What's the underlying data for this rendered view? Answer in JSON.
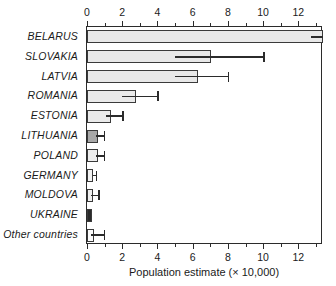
{
  "chart_data": {
    "type": "bar",
    "orientation": "horizontal",
    "title": "",
    "xlabel": "Population estimate (× 10,000)",
    "ylabel": "",
    "xlim": [
      0,
      13.4
    ],
    "ylim": null,
    "grid": false,
    "legend": null,
    "axis_ticks_top": true,
    "axis_ticks_bottom": true,
    "tick_labels": [
      "0",
      "2",
      "4",
      "6",
      "8",
      "10",
      "12"
    ],
    "tick_values": [
      0,
      2,
      4,
      6,
      8,
      10,
      12
    ],
    "minor_tick_values": [
      1,
      3,
      5,
      7,
      9,
      11,
      13
    ],
    "categories": [
      "BELARUS",
      "SLOVAKIA",
      "LATVIA",
      "ROMANIA",
      "ESTONIA",
      "LITHUANIA",
      "POLAND",
      "GERMANY",
      "MOLDOVA",
      "UKRAINE",
      "Other countries"
    ],
    "values": [
      13.4,
      7.05,
      6.3,
      2.8,
      1.35,
      0.62,
      0.6,
      0.35,
      0.32,
      0.28,
      0.4
    ],
    "error_low": [
      12.7,
      5.0,
      5.0,
      2.0,
      1.1,
      0.5,
      0.5,
      0.35,
      0.25,
      null,
      0.25
    ],
    "error_high": [
      13.4,
      10.0,
      8.0,
      4.0,
      2.0,
      0.95,
      0.95,
      0.5,
      0.62,
      null,
      0.95
    ],
    "bar_colors": [
      "#e8e8e8",
      "#e8e8e8",
      "#e8e8e8",
      "#eaeaea",
      "#eaeaea",
      "#a8a8a8",
      "#ededed",
      "#f2f2f2",
      "#f0f0f0",
      "#2a2a2a",
      "#fcfcfc"
    ],
    "bar_edge_color": "#3a3a3a",
    "error_color": "#2b2b2b",
    "background_color": "#ffffff",
    "units": "× 10,000"
  }
}
